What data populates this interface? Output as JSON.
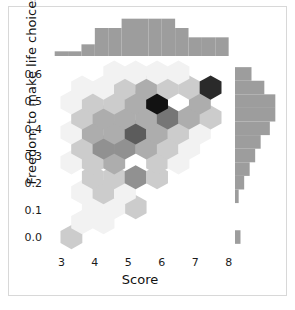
{
  "chart_data": {
    "type": "scatter",
    "subtype": "hexbin-jointplot",
    "title": "",
    "xlabel": "Score",
    "ylabel": "Freedom to make life choices",
    "xlim": [
      2.6,
      8.1
    ],
    "ylim": [
      -0.05,
      0.66
    ],
    "xticks": [
      3,
      4,
      5,
      6,
      7,
      8
    ],
    "xtick_labels": [
      "3",
      "4",
      "5",
      "6",
      "7",
      "8"
    ],
    "yticks": [
      0.0,
      0.1,
      0.2,
      0.3,
      0.4,
      0.5,
      0.6
    ],
    "ytick_labels": [
      "0.0",
      "0.1",
      "0.2",
      "0.3",
      "0.4",
      "0.5",
      "0.6"
    ],
    "grid": false,
    "legend": "none",
    "colormap": "Greys",
    "count_range": [
      1,
      9
    ],
    "hexbins": [
      {
        "x": 3.3,
        "y": 0.005,
        "count": 2
      },
      {
        "x": 3.62,
        "y": 0.06,
        "count": 1
      },
      {
        "x": 4.26,
        "y": 0.06,
        "count": 1
      },
      {
        "x": 5.22,
        "y": 0.115,
        "count": 2
      },
      {
        "x": 3.94,
        "y": 0.115,
        "count": 1
      },
      {
        "x": 4.58,
        "y": 0.115,
        "count": 1
      },
      {
        "x": 3.62,
        "y": 0.17,
        "count": 1
      },
      {
        "x": 4.26,
        "y": 0.17,
        "count": 2
      },
      {
        "x": 4.9,
        "y": 0.17,
        "count": 1
      },
      {
        "x": 3.94,
        "y": 0.225,
        "count": 2
      },
      {
        "x": 4.58,
        "y": 0.225,
        "count": 2
      },
      {
        "x": 5.22,
        "y": 0.225,
        "count": 4
      },
      {
        "x": 5.86,
        "y": 0.225,
        "count": 2
      },
      {
        "x": 3.3,
        "y": 0.28,
        "count": 1
      },
      {
        "x": 3.94,
        "y": 0.28,
        "count": 2
      },
      {
        "x": 4.58,
        "y": 0.28,
        "count": 3
      },
      {
        "x": 5.86,
        "y": 0.28,
        "count": 2
      },
      {
        "x": 6.5,
        "y": 0.28,
        "count": 1
      },
      {
        "x": 3.62,
        "y": 0.335,
        "count": 2
      },
      {
        "x": 4.26,
        "y": 0.335,
        "count": 4
      },
      {
        "x": 4.9,
        "y": 0.335,
        "count": 4
      },
      {
        "x": 5.54,
        "y": 0.335,
        "count": 3
      },
      {
        "x": 6.18,
        "y": 0.335,
        "count": 2
      },
      {
        "x": 6.82,
        "y": 0.335,
        "count": 1
      },
      {
        "x": 3.3,
        "y": 0.39,
        "count": 1
      },
      {
        "x": 3.94,
        "y": 0.39,
        "count": 3
      },
      {
        "x": 4.58,
        "y": 0.39,
        "count": 3
      },
      {
        "x": 5.22,
        "y": 0.39,
        "count": 6
      },
      {
        "x": 5.86,
        "y": 0.39,
        "count": 3
      },
      {
        "x": 6.5,
        "y": 0.39,
        "count": 2
      },
      {
        "x": 7.14,
        "y": 0.39,
        "count": 1
      },
      {
        "x": 3.62,
        "y": 0.445,
        "count": 2
      },
      {
        "x": 4.26,
        "y": 0.445,
        "count": 3
      },
      {
        "x": 4.9,
        "y": 0.445,
        "count": 3
      },
      {
        "x": 5.54,
        "y": 0.445,
        "count": 3
      },
      {
        "x": 6.18,
        "y": 0.445,
        "count": 5
      },
      {
        "x": 6.82,
        "y": 0.445,
        "count": 3
      },
      {
        "x": 7.46,
        "y": 0.445,
        "count": 2
      },
      {
        "x": 3.3,
        "y": 0.5,
        "count": 1
      },
      {
        "x": 3.94,
        "y": 0.5,
        "count": 2
      },
      {
        "x": 4.58,
        "y": 0.5,
        "count": 2
      },
      {
        "x": 5.22,
        "y": 0.5,
        "count": 3
      },
      {
        "x": 5.86,
        "y": 0.5,
        "count": 9
      },
      {
        "x": 7.14,
        "y": 0.5,
        "count": 3
      },
      {
        "x": 3.62,
        "y": 0.555,
        "count": 1
      },
      {
        "x": 4.26,
        "y": 0.555,
        "count": 1
      },
      {
        "x": 4.9,
        "y": 0.555,
        "count": 2
      },
      {
        "x": 5.54,
        "y": 0.555,
        "count": 3
      },
      {
        "x": 6.18,
        "y": 0.555,
        "count": 2
      },
      {
        "x": 6.82,
        "y": 0.555,
        "count": 2
      },
      {
        "x": 7.46,
        "y": 0.555,
        "count": 8
      },
      {
        "x": 5.22,
        "y": 0.61,
        "count": 1
      },
      {
        "x": 5.86,
        "y": 0.61,
        "count": 1
      },
      {
        "x": 6.5,
        "y": 0.61,
        "count": 1
      },
      {
        "x": 4.58,
        "y": 0.61,
        "count": 1
      }
    ],
    "marginal_x": {
      "orientation": "vertical",
      "bin_edges": [
        2.8,
        3.2,
        3.6,
        4.0,
        4.4,
        4.8,
        5.2,
        5.6,
        6.0,
        6.4,
        6.8,
        7.2,
        7.6,
        8.0
      ],
      "counts": [
        2,
        2,
        5,
        12,
        12,
        16,
        16,
        16,
        16,
        12,
        8,
        8,
        8
      ],
      "ymax": 18,
      "color": "#9d9d9d"
    },
    "marginal_y": {
      "orientation": "horizontal",
      "bin_edges": [
        -0.02,
        0.03,
        0.08,
        0.13,
        0.18,
        0.23,
        0.28,
        0.33,
        0.38,
        0.43,
        0.48,
        0.53,
        0.58,
        0.63
      ],
      "counts": [
        3,
        0,
        0,
        2,
        5,
        8,
        11,
        14,
        19,
        22,
        22,
        16,
        9
      ],
      "xmax": 24,
      "color": "#9d9d9d"
    }
  },
  "axes": {
    "x_label": "Score",
    "y_label": "Freedom to make life choices"
  }
}
